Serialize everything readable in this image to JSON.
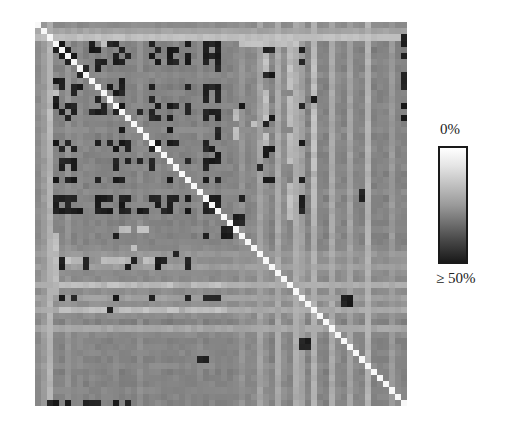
{
  "chart_data": {
    "type": "heatmap",
    "title": "",
    "xlabel": "",
    "ylabel": "",
    "grid": false,
    "n": 62,
    "diagonal": "white (0%)",
    "colorbar": {
      "top_label": "0%",
      "bottom_label": "≥ 50%",
      "min": 0,
      "max": 50,
      "colormap": "grayscale: white = 0%, black = ≥50%",
      "position": "right"
    },
    "row_base": [
      45,
      60,
      78,
      40,
      36,
      38,
      42,
      38,
      44,
      40,
      36,
      40,
      38,
      42,
      36,
      40,
      38,
      44,
      36,
      40,
      42,
      38,
      36,
      42,
      38,
      40,
      36,
      44,
      38,
      42,
      38,
      40,
      36,
      42,
      38,
      40,
      44,
      52,
      48,
      56,
      46,
      44,
      66,
      46,
      58,
      48,
      64,
      46,
      36,
      62,
      44,
      38,
      40,
      42,
      38,
      44,
      36,
      40,
      38,
      42,
      40,
      38
    ],
    "col_base": [
      45,
      55,
      70,
      40,
      38,
      50,
      40,
      44,
      38,
      42,
      36,
      40,
      38,
      42,
      36,
      40,
      38,
      46,
      38,
      40,
      42,
      38,
      36,
      42,
      38,
      40,
      36,
      44,
      38,
      42,
      38,
      40,
      36,
      42,
      50,
      40,
      44,
      60,
      48,
      38,
      64,
      46,
      40,
      66,
      58,
      38,
      68,
      40,
      36,
      64,
      44,
      38,
      60,
      42,
      38,
      70,
      36,
      40,
      38,
      54,
      40,
      38
    ],
    "dark_cells": [
      [
        3,
        4
      ],
      [
        4,
        3
      ],
      [
        3,
        9
      ],
      [
        3,
        12
      ],
      [
        3,
        13
      ],
      [
        3,
        19
      ],
      [
        3,
        25
      ],
      [
        3,
        28
      ],
      [
        3,
        29
      ],
      [
        5,
        4
      ],
      [
        5,
        6
      ],
      [
        5,
        13
      ],
      [
        5,
        15
      ],
      [
        5,
        19
      ],
      [
        5,
        25
      ],
      [
        5,
        28
      ],
      [
        5,
        29
      ],
      [
        5,
        30
      ],
      [
        6,
        6
      ],
      [
        6,
        10
      ],
      [
        6,
        13
      ],
      [
        8,
        7
      ],
      [
        9,
        4
      ],
      [
        9,
        14
      ],
      [
        10,
        4
      ],
      [
        10,
        6
      ],
      [
        10,
        7
      ],
      [
        10,
        12
      ],
      [
        10,
        14
      ],
      [
        10,
        19
      ],
      [
        10,
        25
      ],
      [
        10,
        28
      ],
      [
        10,
        29
      ],
      [
        10,
        30
      ],
      [
        11,
        6
      ],
      [
        11,
        11
      ],
      [
        11,
        13
      ],
      [
        11,
        14
      ],
      [
        11,
        28
      ],
      [
        12,
        19
      ],
      [
        12,
        28
      ],
      [
        14,
        4
      ],
      [
        14,
        6
      ],
      [
        14,
        13
      ],
      [
        14,
        17
      ],
      [
        14,
        19
      ],
      [
        14,
        25
      ],
      [
        14,
        28
      ],
      [
        14,
        29
      ],
      [
        14,
        30
      ],
      [
        15,
        19
      ],
      [
        15,
        20
      ],
      [
        20,
        4
      ],
      [
        20,
        6
      ],
      [
        20,
        13
      ],
      [
        20,
        19
      ],
      [
        20,
        28
      ],
      [
        20,
        29
      ],
      [
        22,
        4
      ],
      [
        22,
        5
      ],
      [
        22,
        6
      ],
      [
        22,
        13
      ],
      [
        22,
        15
      ],
      [
        22,
        17
      ],
      [
        22,
        19
      ],
      [
        22,
        25
      ],
      [
        22,
        28
      ],
      [
        22,
        29
      ],
      [
        22,
        30
      ],
      [
        23,
        4
      ],
      [
        23,
        6
      ],
      [
        23,
        13
      ],
      [
        23,
        19
      ],
      [
        23,
        28
      ],
      [
        25,
        6
      ],
      [
        25,
        13
      ],
      [
        25,
        28
      ],
      [
        28,
        4
      ],
      [
        28,
        6
      ],
      [
        28,
        11
      ],
      [
        28,
        12
      ],
      [
        28,
        15
      ],
      [
        28,
        19
      ],
      [
        28,
        28
      ],
      [
        28,
        29
      ],
      [
        30,
        3
      ],
      [
        30,
        4
      ],
      [
        30,
        6
      ],
      [
        30,
        7
      ],
      [
        30,
        10
      ],
      [
        30,
        11
      ],
      [
        30,
        12
      ],
      [
        30,
        14
      ],
      [
        30,
        15
      ],
      [
        30,
        17
      ],
      [
        30,
        18
      ],
      [
        30,
        21
      ],
      [
        30,
        22
      ],
      [
        30,
        25
      ],
      [
        30,
        28
      ],
      [
        30,
        29
      ],
      [
        30,
        30
      ],
      [
        34,
        13
      ],
      [
        34,
        28
      ],
      [
        44,
        4
      ],
      [
        44,
        6
      ],
      [
        44,
        13
      ],
      [
        44,
        19
      ],
      [
        44,
        25
      ],
      [
        44,
        28
      ],
      [
        44,
        29
      ],
      [
        44,
        30
      ],
      [
        4,
        38
      ],
      [
        4,
        39
      ],
      [
        8,
        38
      ],
      [
        8,
        39
      ],
      [
        12,
        46
      ],
      [
        15,
        39
      ],
      [
        16,
        38
      ],
      [
        20,
        38
      ],
      [
        20,
        39
      ],
      [
        21,
        38
      ],
      [
        23,
        37
      ],
      [
        25,
        38
      ],
      [
        25,
        39
      ],
      [
        27,
        54
      ],
      [
        28,
        54
      ],
      [
        31,
        33
      ],
      [
        31,
        34
      ],
      [
        32,
        33
      ],
      [
        32,
        34
      ],
      [
        2,
        61
      ],
      [
        3,
        61
      ],
      [
        5,
        61
      ],
      [
        8,
        61
      ],
      [
        9,
        61
      ],
      [
        10,
        61
      ],
      [
        13,
        61
      ],
      [
        15,
        61
      ],
      [
        44,
        51
      ],
      [
        44,
        52
      ],
      [
        45,
        51
      ],
      [
        45,
        52
      ]
    ],
    "light_cells": [
      [
        2,
        14
      ],
      [
        2,
        15
      ],
      [
        2,
        17
      ],
      [
        2,
        27
      ],
      [
        11,
        3
      ],
      [
        12,
        3
      ],
      [
        13,
        3
      ],
      [
        9,
        3
      ],
      [
        34,
        3
      ],
      [
        35,
        3
      ],
      [
        36,
        3
      ],
      [
        37,
        3
      ],
      [
        38,
        3
      ],
      [
        39,
        3
      ],
      [
        40,
        3
      ],
      [
        41,
        3
      ],
      [
        42,
        3
      ],
      [
        43,
        3
      ],
      [
        42,
        4
      ],
      [
        42,
        5
      ],
      [
        42,
        6
      ],
      [
        42,
        7
      ],
      [
        42,
        8
      ],
      [
        42,
        9
      ],
      [
        42,
        10
      ],
      [
        42,
        12
      ],
      [
        42,
        13
      ],
      [
        42,
        14
      ],
      [
        42,
        15
      ],
      [
        42,
        16
      ],
      [
        42,
        18
      ],
      [
        42,
        19
      ],
      [
        42,
        20
      ],
      [
        42,
        21
      ],
      [
        42,
        22
      ],
      [
        42,
        26
      ],
      [
        42,
        27
      ],
      [
        42,
        28
      ],
      [
        42,
        29
      ],
      [
        42,
        30
      ],
      [
        42,
        31
      ],
      [
        46,
        4
      ],
      [
        46,
        5
      ],
      [
        46,
        6
      ],
      [
        46,
        7
      ],
      [
        46,
        8
      ],
      [
        46,
        9
      ],
      [
        46,
        10
      ],
      [
        46,
        11
      ],
      [
        46,
        14
      ],
      [
        46,
        15
      ],
      [
        46,
        16
      ],
      [
        46,
        17
      ],
      [
        46,
        18
      ],
      [
        46,
        19
      ],
      [
        46,
        20
      ],
      [
        46,
        21
      ],
      [
        46,
        22
      ],
      [
        46,
        23
      ],
      [
        46,
        25
      ],
      [
        46,
        26
      ],
      [
        46,
        27
      ],
      [
        46,
        28
      ],
      [
        46,
        29
      ],
      [
        46,
        30
      ],
      [
        46,
        31
      ],
      [
        38,
        4
      ],
      [
        38,
        5
      ],
      [
        38,
        6
      ],
      [
        38,
        7
      ],
      [
        38,
        11
      ],
      [
        38,
        12
      ],
      [
        38,
        13
      ],
      [
        38,
        14
      ],
      [
        38,
        15
      ],
      [
        38,
        16
      ],
      [
        38,
        18
      ],
      [
        38,
        19
      ],
      [
        38,
        20
      ],
      [
        38,
        21
      ],
      [
        33,
        14
      ],
      [
        33,
        15
      ],
      [
        33,
        17
      ],
      [
        33,
        18
      ],
      [
        36,
        16
      ]
    ]
  }
}
